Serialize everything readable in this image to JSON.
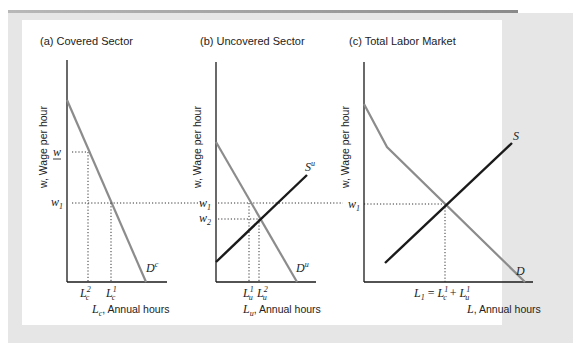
{
  "panels": [
    {
      "id": "a",
      "title": "(a) Covered Sector",
      "ylabel": "w, Wage per hour",
      "xlabel_var": "L",
      "xlabel_sub": "c",
      "xlabel_rest": ", Annual hours",
      "demand_label": "D",
      "demand_sup": "c",
      "wage_labels": [
        {
          "name": "min-wage",
          "text": "w",
          "underline": true
        },
        {
          "name": "w1",
          "text": "w",
          "sub": "1"
        }
      ],
      "qty_labels": [
        {
          "text": "L",
          "sub": "c",
          "sup": "2"
        },
        {
          "text": "L",
          "sub": "c",
          "sup": "1"
        }
      ]
    },
    {
      "id": "b",
      "title": "(b) Uncovered Sector",
      "ylabel": "w, Wage per hour",
      "xlabel_var": "L",
      "xlabel_sub": "u",
      "xlabel_rest": ", Annual hours",
      "demand_label": "D",
      "demand_sup": "u",
      "supply_label": "S",
      "supply_sup": "u",
      "wage_labels": [
        {
          "name": "w1",
          "text": "w",
          "sub": "1"
        },
        {
          "name": "w2",
          "text": "w",
          "sub": "2"
        }
      ],
      "qty_labels": [
        {
          "text": "L",
          "sub": "u",
          "sup": "1"
        },
        {
          "text": "L",
          "sub": "u",
          "sup": "2"
        }
      ]
    },
    {
      "id": "c",
      "title": "(c) Total Labor Market",
      "ylabel": "w, Wage per hour",
      "xlabel_var": "L",
      "xlabel_rest": ", Annual hours",
      "demand_label": "D",
      "supply_label": "S",
      "wage_labels": [
        {
          "name": "w1",
          "text": "w",
          "sub": "1"
        }
      ],
      "equilibrium_label": {
        "lhs": "L",
        "lhs_sub": "1",
        "eq": " = ",
        "t1": "L",
        "t1_sub": "c",
        "t1_sup": "1",
        "plus": " + ",
        "t2": "L",
        "t2_sub": "u",
        "t2_sup": "1"
      }
    }
  ],
  "colors": {
    "demand": "#8c8c8c",
    "supply": "#1a1a1a",
    "axis": "#1a1a1a",
    "dotted": "#333333",
    "frame": "#e6e6e6"
  }
}
